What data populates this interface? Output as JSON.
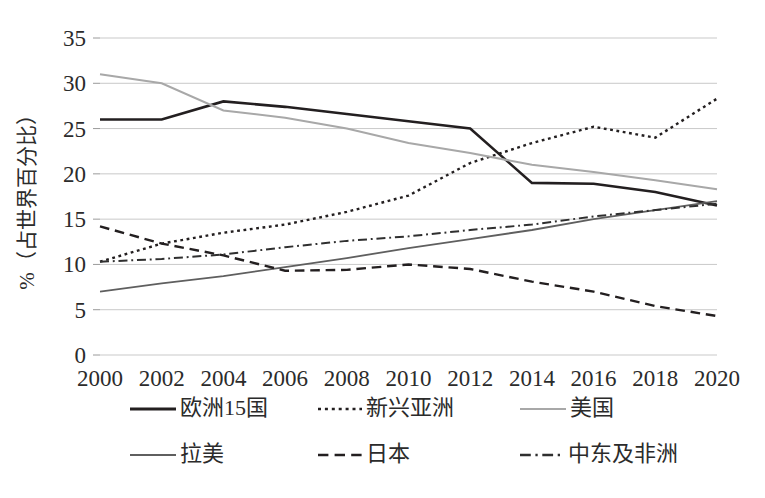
{
  "chart_data": {
    "type": "line",
    "title": "",
    "subtitle": "",
    "xlabel": "",
    "ylabel": "%（占世界百分比）",
    "x": [
      2000,
      2002,
      2004,
      2006,
      2008,
      2010,
      2012,
      2014,
      2016,
      2018,
      2020
    ],
    "xtick_labels": [
      "2000",
      "2002",
      "2004",
      "2006",
      "2008",
      "2010",
      "2012",
      "2014",
      "2016",
      "2018",
      "2020"
    ],
    "ytick_labels": [
      "0",
      "5",
      "10",
      "15",
      "20",
      "25",
      "30",
      "35"
    ],
    "yticks": [
      0,
      5,
      10,
      15,
      20,
      25,
      30,
      35
    ],
    "ylim": [
      0,
      35
    ],
    "xlim": [
      2000,
      2020
    ],
    "grid": true,
    "legend_position": "bottom",
    "series": [
      {
        "name": "欧洲15国",
        "values": [
          26.0,
          26.0,
          28.0,
          27.4,
          26.6,
          25.8,
          25.0,
          19.0,
          18.9,
          18.0,
          16.5
        ],
        "style": "solid",
        "color": "#231f20",
        "width": 2.6
      },
      {
        "name": "新兴亚洲",
        "values": [
          10.3,
          12.3,
          13.5,
          14.4,
          15.8,
          17.6,
          21.2,
          23.4,
          25.2,
          24.0,
          28.3
        ],
        "style": "dotted",
        "color": "#231f20",
        "width": 2.4
      },
      {
        "name": "美国",
        "values": [
          31.0,
          30.0,
          27.0,
          26.2,
          25.0,
          23.4,
          22.3,
          21.0,
          20.2,
          19.3,
          18.3
        ],
        "style": "solid",
        "color": "#a8a8a8",
        "width": 2.0
      },
      {
        "name": "拉美",
        "values": [
          7.0,
          7.9,
          8.7,
          9.7,
          10.7,
          11.8,
          12.8,
          13.8,
          15.0,
          16.0,
          17.0
        ],
        "style": "solid",
        "color": "#5f5f5f",
        "width": 1.8
      },
      {
        "name": "日本",
        "values": [
          14.2,
          12.3,
          11.0,
          9.3,
          9.4,
          10.0,
          9.5,
          8.1,
          7.0,
          5.4,
          4.3
        ],
        "style": "dashed",
        "color": "#231f20",
        "width": 2.4
      },
      {
        "name": "中东及非洲",
        "values": [
          10.3,
          10.6,
          11.1,
          11.9,
          12.6,
          13.1,
          13.8,
          14.4,
          15.3,
          16.0,
          16.7
        ],
        "style": "dashdot",
        "color": "#2f2f2f",
        "width": 2.0
      }
    ]
  },
  "legend": {
    "entries": [
      {
        "label": "欧洲15国",
        "style": "solid",
        "color": "#231f20",
        "width": 2.8
      },
      {
        "label": "新兴亚洲",
        "style": "dotted",
        "color": "#231f20",
        "width": 2.6
      },
      {
        "label": "美国",
        "style": "solid",
        "color": "#a8a8a8",
        "width": 2.2
      },
      {
        "label": "拉美",
        "style": "solid",
        "color": "#5f5f5f",
        "width": 2.2
      },
      {
        "label": "日本",
        "style": "dashed",
        "color": "#231f20",
        "width": 2.6
      },
      {
        "label": "中东及非洲",
        "style": "dashdot",
        "color": "#2f2f2f",
        "width": 2.4
      }
    ]
  },
  "colors": {
    "background": "#ffffff",
    "gridline": "#c9c9c9",
    "text": "#2b2b2b"
  }
}
